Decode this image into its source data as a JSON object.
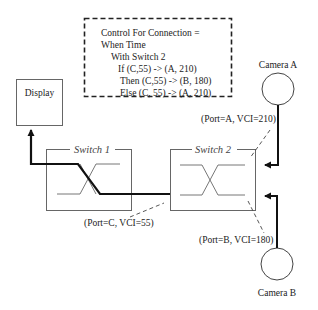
{
  "diagram": {
    "type": "network-diagram",
    "control_box": {
      "lines": [
        "Control For Connection =",
        "When Time",
        "With Switch 2",
        "If (C,55) -> (A, 210)",
        "Then (C,55) -> (B, 180)",
        "Else (C, 55) -> (A, 210)"
      ]
    },
    "nodes": {
      "display": {
        "label": "Display"
      },
      "switch1": {
        "label": "Switch 1"
      },
      "switch2": {
        "label": "Switch 2"
      },
      "camera_a": {
        "label": "Camera A"
      },
      "camera_b": {
        "label": "Camera B"
      }
    },
    "port_labels": {
      "port_a": "(Port=A, VCI=210)",
      "port_b": "(Port=B, VCI=180)",
      "port_c": "(Port=C, VCI=55)"
    },
    "edges": [
      {
        "from": "Camera A",
        "to": "Switch 2",
        "port": "A",
        "vci": 210
      },
      {
        "from": "Camera B",
        "to": "Switch 2",
        "port": "B",
        "vci": 180
      },
      {
        "from": "Switch 2",
        "to": "Switch 1",
        "port": "C",
        "vci": 55
      },
      {
        "from": "Switch 1",
        "to": "Display"
      }
    ],
    "colors": {
      "line": "#222222",
      "box": "#666666",
      "path": "#111111"
    }
  }
}
